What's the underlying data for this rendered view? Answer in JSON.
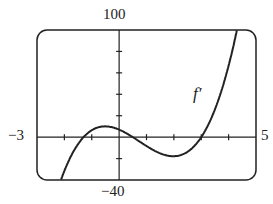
{
  "chart_data": {
    "type": "line",
    "title": "",
    "series": [
      {
        "name": "f'",
        "function": "3.6*(x+1.3)*(x-0.5)*(x-3)",
        "x": [
          -2.1,
          -1.3,
          -0.5,
          0,
          0.5,
          1,
          2,
          3,
          3.5,
          4,
          4.3
        ],
        "values": [
          -40,
          0,
          10,
          7,
          0,
          -7,
          -18,
          0,
          14,
          54,
          100
        ]
      }
    ],
    "xlim": [
      -3,
      5
    ],
    "ylim": [
      -40,
      100
    ],
    "x_tick_step": 1,
    "y_tick_step": 20,
    "xlabel": "",
    "ylabel": "",
    "grid": false,
    "annotations": [
      {
        "text": "f'",
        "x": 2.8,
        "y": 55
      }
    ]
  },
  "labels": {
    "xmin": "−3",
    "xmax": "5",
    "ymax": "100",
    "ymin": "−40",
    "curve": "f′"
  }
}
